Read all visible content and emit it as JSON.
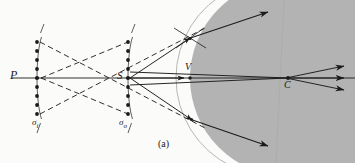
{
  "figure": {
    "caption": "(a)",
    "domain_kind": "optics-ray-diagram",
    "background_color": "#fbfbf9",
    "medium_color": "#b3b3b3",
    "ink_color": "#1a1a1a"
  },
  "labels": {
    "point_p": "P",
    "point_s": "S",
    "point_v": "V",
    "point_c": "C",
    "sigma_i_base": "σ",
    "sigma_i_sub": "i",
    "sigma_o_base": "σ",
    "sigma_o_sub": "o"
  },
  "geometry": {
    "axis_y": 78,
    "p_x": 37,
    "s_x": 128,
    "v_x": 190,
    "c_x": 288,
    "sphere_center_x": 288,
    "sphere_radius": 98,
    "wavefront_i_x": 37,
    "wavefront_o_x": 128,
    "dot_count": 9,
    "dot_spacing": 9,
    "dot_radius": 1.9
  },
  "rays": {
    "solid_count": 5,
    "dashed_count": 4,
    "exit_arrow_count": 3,
    "normal_cross_count": 2
  }
}
